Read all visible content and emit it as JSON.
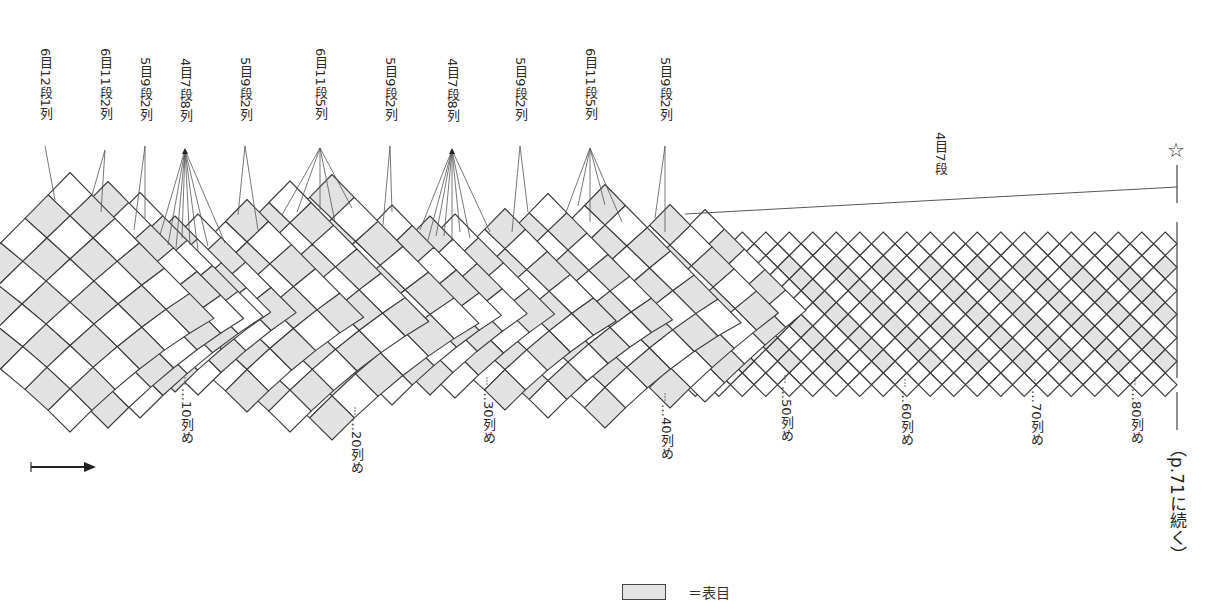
{
  "diagram": {
    "type": "lace-chart",
    "direction_arrow": "right-arrow",
    "colors": {
      "line": "#3c3c3c",
      "shade": "#e2e2e2",
      "background": "#ffffff"
    },
    "top_labels": [
      {
        "text": "6目12段1列",
        "x": 45
      },
      {
        "text": "6目11段2列",
        "x": 105
      },
      {
        "text": "5目9段2列",
        "x": 145
      },
      {
        "text": "4目7段8列",
        "x": 185
      },
      {
        "text": "5目9段2列",
        "x": 245
      },
      {
        "text": "6目11段5列",
        "x": 320
      },
      {
        "text": "5目9段2列",
        "x": 390
      },
      {
        "text": "4目7段8列",
        "x": 452
      },
      {
        "text": "5目9段2列",
        "x": 520
      },
      {
        "text": "6目11段5列",
        "x": 590
      },
      {
        "text": "5目9段2列",
        "x": 665
      }
    ],
    "section_label": {
      "text": "4目7段",
      "x": 940
    },
    "column_markers": [
      {
        "text": "…10列め",
        "x": 185
      },
      {
        "text": "…20列め",
        "x": 355
      },
      {
        "text": "…30列め",
        "x": 487
      },
      {
        "text": "…40列め",
        "x": 665
      },
      {
        "text": "…50列め",
        "x": 785
      },
      {
        "text": "…60列め",
        "x": 905
      },
      {
        "text": "…70列め",
        "x": 1035
      },
      {
        "text": "…80列め",
        "x": 1135
      }
    ],
    "end_marker": "☆",
    "continuation": "（p.71に続く）",
    "legend": {
      "label": "＝表目"
    }
  }
}
